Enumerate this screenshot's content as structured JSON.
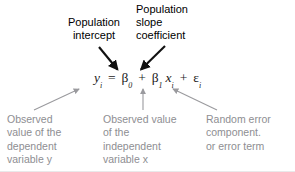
{
  "figure": {
    "background_color": "#ffffff",
    "arrow_color_top": "#111111",
    "arrow_color_bottom": "#9a9a9e",
    "text_color_top": "#000000",
    "text_color_bottom": "#8e8e92",
    "equation_color": "#1a1a1a"
  },
  "equation": {
    "full_text": "yi = β0 + β1 xi + εi",
    "terms": {
      "dependent": "y",
      "dependent_subscript": "i",
      "equals": "=",
      "intercept": "β",
      "intercept_subscript": "0",
      "plus_1": "+",
      "slope": "β",
      "slope_subscript": "1",
      "independent": "x",
      "independent_subscript": "i",
      "plus_2": "+",
      "error": "ε",
      "error_subscript": "i"
    }
  },
  "annotations": {
    "top": [
      {
        "id": "population-intercept",
        "text": "Population\nintercept",
        "points_to": "β0"
      },
      {
        "id": "population-slope-coefficient",
        "text": "Population\nslope\ncoefficient",
        "points_to": "β1"
      }
    ],
    "bottom": [
      {
        "id": "observed-value-dependent",
        "text": "Observed\nvalue of the\ndependent\nvariable y",
        "points_to": "yi"
      },
      {
        "id": "observed-value-independent",
        "text": "Observed value\nof the\nindependent\nvariable x",
        "points_to": "xi"
      },
      {
        "id": "random-error-component",
        "text": "Random error\ncomponent.\nor error term",
        "points_to": "εi"
      }
    ]
  }
}
